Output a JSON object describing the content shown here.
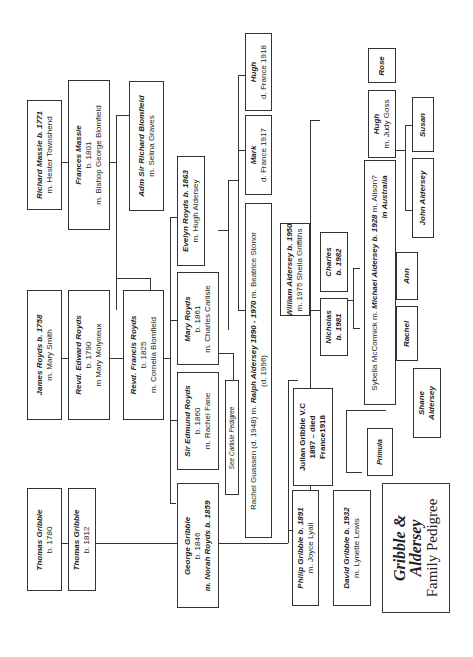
{
  "title": {
    "line1": "Gribble &",
    "line2": "Aldersey",
    "line3": "Family Pedigree"
  },
  "people": {
    "richard_massie": {
      "name": "Richard Massie b. 1771",
      "detail": "m. Hester Townshend"
    },
    "frances_massie": {
      "name": "Frances Massie",
      "born": "b. 1801",
      "detail": "m. Bishop George Blomfield"
    },
    "adm_blomfield": {
      "name": "Adm Sir Richard Blomfield",
      "detail": "m. Selina Graves"
    },
    "james_royds": {
      "name": "James Royds b. 1758",
      "detail": "m. Mary Smith"
    },
    "edward_royds": {
      "name": "Revd. Edward Royds",
      "born": "b. 1790",
      "detail": "m Mary Molyneux"
    },
    "francis_royds": {
      "name": "Revd. Francis Royds",
      "born": "b. 1825",
      "detail": "m. Cornelia Blomfield"
    },
    "evelyn_royds": {
      "name": "Evelyn Royds b. 1863",
      "detail": "m. Hugh Aldersey"
    },
    "mary_royds": {
      "name": "Mary Royds",
      "born": "b. 1861",
      "detail": "m. Charles Carlisle"
    },
    "edmund_royds": {
      "name": "Sir Edmund Royds",
      "born": "b. 1860",
      "detail": "m. Rachel Fane"
    },
    "carlisle_note": {
      "detail": "See Carlisle Pedigree"
    },
    "thomas_gribble_1780": {
      "name": "Thomas Gribble",
      "born": "b. 1780"
    },
    "thomas_gribble_1812": {
      "name": "Thomas Gribble",
      "born": "b. 1812"
    },
    "george_gribble": {
      "name": "George Gribble",
      "born": "b. 1846",
      "detail": "m. Norah Royds b. 1859"
    },
    "ralph_aldersey": {
      "line1_a": "Rachel Guassen (d. 1948) m. ",
      "line1_b": "Ralph Aldersey 1890 - 1970",
      "line1_c": " m. Beatrice Stonor",
      "line2": "(d. 1996)"
    },
    "mark": {
      "name": "Mark",
      "detail": "d. France 1917"
    },
    "hugh_1918": {
      "name": "Hugh",
      "detail": "d. France 1918"
    },
    "william_aldersey": {
      "name": "William Aldersey b. 1950",
      "detail": "m. 1975 Sheila Griffiths"
    },
    "nicholas": {
      "name": "Nicholas",
      "born": "b. 1981"
    },
    "charles": {
      "name": "Charles",
      "born": "b. 1982"
    },
    "julian_gribble": {
      "name": "Julian Gribble V.C",
      "born": "1897 – died",
      "detail": "France1918"
    },
    "philip_gribble": {
      "name": "Philip Gribble b. 1891",
      "detail": "m. Joyce Lyall"
    },
    "david_gribble": {
      "name": "David Gribble b. 1932",
      "detail": "m. Lynette Lewis"
    },
    "michael_aldersey": {
      "line1_a": "Sybella McCormick m. ",
      "line1_b": "Michael Aldersey b. 1928",
      "line1_c": " m. Alison?",
      "line2": "in Australia"
    },
    "rose": {
      "name": "Rose"
    },
    "hugh_goss": {
      "name": "Hugh",
      "detail": "m. Judy Goss"
    },
    "susan": {
      "name": "Susan"
    },
    "john_aldersey": {
      "name": "John Aldersey"
    },
    "ann": {
      "name": "Ann"
    },
    "rachel": {
      "name": "Rachel"
    },
    "shane_aldersey": {
      "name": "Shane",
      "detail": "Aldersey"
    },
    "primula": {
      "name": "Primula"
    }
  }
}
